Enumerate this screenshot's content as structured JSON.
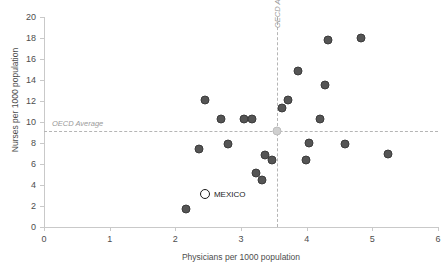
{
  "chart_data": {
    "type": "scatter",
    "title": "",
    "xlabel": "Physicians per 1000 population",
    "ylabel": "Nurses per 1000 population",
    "xlim": [
      0,
      6
    ],
    "ylim": [
      0,
      20
    ],
    "xticks": [
      0,
      1,
      2,
      3,
      4,
      5,
      6
    ],
    "yticks": [
      0,
      2,
      4,
      6,
      8,
      10,
      12,
      14,
      16,
      18,
      20
    ],
    "xtick_labels": [
      "0",
      "1",
      "2",
      "3",
      "4",
      "5",
      "6"
    ],
    "ytick_labels": [
      "0",
      "2",
      "4",
      "6",
      "8",
      "10",
      "12",
      "14",
      "16",
      "18",
      "20"
    ],
    "grid": false,
    "legend": null,
    "reference_lines": [
      {
        "orientation": "horizontal",
        "label": "OECD Average",
        "value": 9.1,
        "style": "dashed",
        "color": "#b5b5b5"
      },
      {
        "orientation": "vertical",
        "label": "OECD Average",
        "value": 3.55,
        "style": "dashed",
        "color": "#b5b5b5"
      }
    ],
    "series": [
      {
        "name": "Countries",
        "marker": "filled-circle",
        "color": "#555555",
        "points": [
          {
            "x": 2.16,
            "y": 1.7
          },
          {
            "x": 2.36,
            "y": 7.4
          },
          {
            "x": 2.45,
            "y": 12.1
          },
          {
            "x": 2.7,
            "y": 10.3
          },
          {
            "x": 2.8,
            "y": 7.9
          },
          {
            "x": 3.04,
            "y": 10.3
          },
          {
            "x": 3.16,
            "y": 10.3
          },
          {
            "x": 3.23,
            "y": 5.1
          },
          {
            "x": 3.32,
            "y": 4.5
          },
          {
            "x": 3.37,
            "y": 6.9
          },
          {
            "x": 3.47,
            "y": 6.4
          },
          {
            "x": 3.63,
            "y": 11.3
          },
          {
            "x": 3.72,
            "y": 12.1
          },
          {
            "x": 3.87,
            "y": 14.9
          },
          {
            "x": 3.99,
            "y": 6.4
          },
          {
            "x": 4.03,
            "y": 8.0
          },
          {
            "x": 4.2,
            "y": 10.3
          },
          {
            "x": 4.28,
            "y": 13.5
          },
          {
            "x": 4.33,
            "y": 17.8
          },
          {
            "x": 4.59,
            "y": 7.9
          },
          {
            "x": 4.82,
            "y": 18.0
          },
          {
            "x": 5.24,
            "y": 7.0
          }
        ]
      },
      {
        "name": "OECD Average",
        "marker": "light-circle",
        "color": "#cfcfcf",
        "points": [
          {
            "x": 3.55,
            "y": 9.1
          }
        ]
      },
      {
        "name": "MEXICO",
        "marker": "open-circle",
        "color": "#1a1a1a",
        "points": [
          {
            "x": 2.45,
            "y": 3.1,
            "label": "MEXICO"
          }
        ]
      }
    ]
  }
}
